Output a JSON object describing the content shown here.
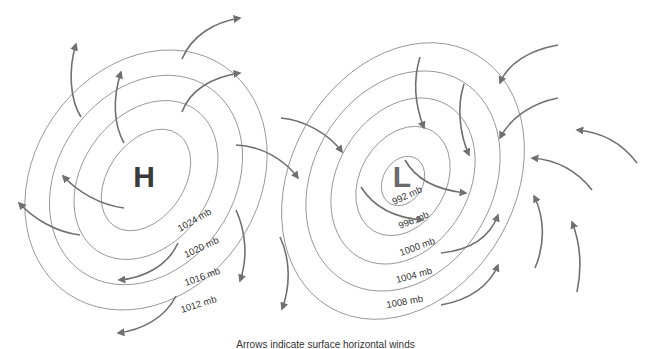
{
  "diagram": {
    "high_pressure": {
      "center_label": "H",
      "center_color": "#3a3a3a",
      "isobars": [
        "1024 mb",
        "1020 mb",
        "1016 mb",
        "1012 mb"
      ],
      "wind_direction": "clockwise, outward (divergent)"
    },
    "low_pressure": {
      "center_label": "L",
      "center_color": "#6a6a6a",
      "isobars": [
        "992 mb",
        "996 mb",
        "1000 mb",
        "1004 mb",
        "1008 mb"
      ],
      "wind_direction": "counterclockwise, inward (convergent)"
    },
    "caption": "Arrows indicate surface horizontal winds",
    "colors": {
      "isobar": "#8a8a8a",
      "arrow": "#707070",
      "background": "#ffffff"
    }
  }
}
